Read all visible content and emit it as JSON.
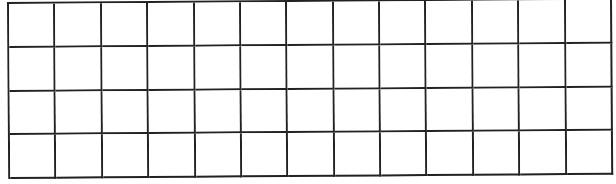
{
  "grid": {
    "rows": 4,
    "columns": 13,
    "line_color": "#222222",
    "background_color": "#ffffff",
    "cells_content": "empty"
  }
}
